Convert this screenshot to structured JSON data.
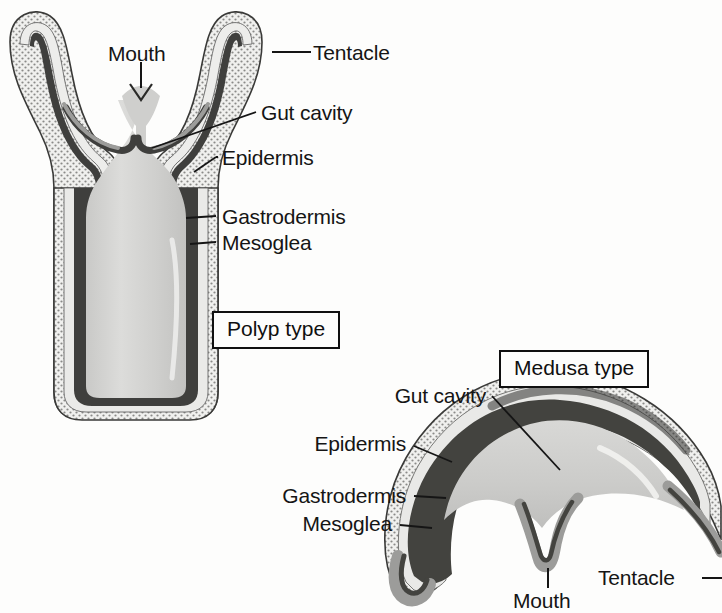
{
  "figure": {
    "background_color": "#fdfdfc",
    "ink_color": "#151515"
  },
  "polyp": {
    "box_label": "Polyp type",
    "labels": {
      "mouth": "Mouth",
      "tentacle": "Tentacle",
      "gut_cavity": "Gut cavity",
      "epidermis": "Epidermis",
      "gastrodermis": "Gastrodermis",
      "mesoglea": "Mesoglea"
    }
  },
  "medusa": {
    "box_label": "Medusa type",
    "labels": {
      "gut_cavity": "Gut cavity",
      "epidermis": "Epidermis",
      "gastrodermis": "Gastrodermis",
      "mesoglea": "Mesoglea",
      "mouth": "Mouth",
      "tentacle": "Tentacle"
    }
  },
  "colors": {
    "gut_cavity_fill": "#d3d3d1",
    "mesoglea_fill": "#e8e8e6",
    "gastrodermis_fill": "#4a4a48",
    "epidermis_fill": "#9a9a98",
    "outline": "#2a2a28"
  }
}
